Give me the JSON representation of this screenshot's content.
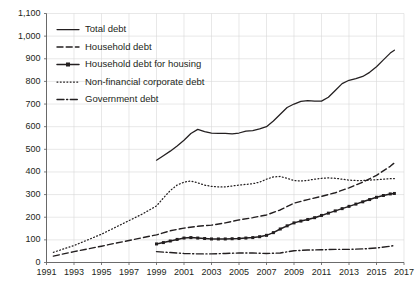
{
  "chart_data": {
    "type": "line",
    "title": "",
    "subtitle": "",
    "xlabel": "",
    "ylabel": "",
    "xlim": [
      1991,
      2017
    ],
    "ylim": [
      0,
      1100
    ],
    "ytick_step": 100,
    "xtick_step": 2,
    "grid": true,
    "legend_position": "top-left",
    "ytick_labels": [
      "0",
      "100",
      "200",
      "300",
      "400",
      "500",
      "600",
      "700",
      "800",
      "900",
      "1,000",
      "1,100"
    ],
    "ytick_values": [
      0,
      100,
      200,
      300,
      400,
      500,
      600,
      700,
      800,
      900,
      1000,
      1100
    ],
    "xtick_labels": [
      "1991",
      "1993",
      "1995",
      "1997",
      "1999",
      "2001",
      "2003",
      "2005",
      "2007",
      "2009",
      "2011",
      "2013",
      "2015",
      "2017"
    ],
    "xtick_values": [
      1991,
      1993,
      1995,
      1997,
      1999,
      2001,
      2003,
      2005,
      2007,
      2009,
      2011,
      2013,
      2015,
      2017
    ],
    "series": [
      {
        "name": "Total debt",
        "style": "solid",
        "color": "#231f20",
        "marker": "none",
        "x": [
          1999.0,
          1999.5,
          2000.0,
          2000.5,
          2001.0,
          2001.5,
          2002.0,
          2002.5,
          2003.0,
          2003.5,
          2004.0,
          2004.5,
          2005.0,
          2005.5,
          2006.0,
          2006.5,
          2007.0,
          2007.5,
          2008.0,
          2008.5,
          2009.0,
          2009.5,
          2010.0,
          2010.5,
          2011.0,
          2011.5,
          2012.0,
          2012.5,
          2013.0,
          2013.5,
          2014.0,
          2014.5,
          2015.0,
          2015.5,
          2016.0,
          2016.3
        ],
        "values": [
          452,
          472,
          492,
          515,
          540,
          570,
          588,
          578,
          572,
          570,
          570,
          568,
          572,
          580,
          583,
          590,
          600,
          625,
          655,
          685,
          700,
          712,
          715,
          713,
          713,
          730,
          760,
          790,
          805,
          812,
          822,
          840,
          865,
          895,
          925,
          938
        ]
      },
      {
        "name": "Household debt",
        "style": "dashed",
        "color": "#231f20",
        "marker": "none",
        "x": [
          1991.5,
          1992,
          1993,
          1994,
          1995,
          1996,
          1997,
          1998,
          1999,
          2000,
          2001,
          2002,
          2003,
          2004,
          2005,
          2006,
          2007,
          2008,
          2009,
          2010,
          2011,
          2012,
          2013,
          2014,
          2015,
          2016,
          2016.3
        ],
        "values": [
          28,
          35,
          48,
          60,
          72,
          85,
          97,
          110,
          122,
          140,
          152,
          160,
          165,
          175,
          188,
          198,
          210,
          232,
          262,
          278,
          292,
          308,
          330,
          355,
          385,
          425,
          440
        ]
      },
      {
        "name": "Household debt for housing",
        "style": "solid-marker",
        "color": "#231f20",
        "marker": "square",
        "x": [
          1999,
          1999.5,
          2000,
          2000.5,
          2001,
          2001.5,
          2002,
          2002.5,
          2003,
          2003.5,
          2004,
          2004.5,
          2005,
          2005.5,
          2006,
          2006.5,
          2007,
          2007.5,
          2008,
          2008.5,
          2009,
          2009.5,
          2010,
          2010.5,
          2011,
          2011.5,
          2012,
          2012.5,
          2013,
          2013.5,
          2014,
          2014.5,
          2015,
          2015.5,
          2016,
          2016.3
        ],
        "values": [
          82,
          88,
          95,
          102,
          108,
          110,
          108,
          106,
          104,
          104,
          104,
          105,
          106,
          108,
          110,
          114,
          120,
          132,
          148,
          162,
          175,
          183,
          190,
          198,
          208,
          218,
          228,
          238,
          248,
          258,
          268,
          278,
          288,
          296,
          303,
          305
        ]
      },
      {
        "name": "Non-financial corporate debt",
        "style": "dotted",
        "color": "#231f20",
        "marker": "none",
        "x": [
          1991.5,
          1992,
          1993,
          1994,
          1995,
          1996,
          1997,
          1998,
          1999,
          1999.5,
          2000,
          2000.5,
          2001,
          2001.5,
          2002,
          2002.5,
          2003,
          2003.5,
          2004,
          2004.5,
          2005,
          2005.5,
          2006,
          2006.5,
          2007,
          2007.5,
          2008,
          2008.5,
          2009,
          2009.5,
          2010,
          2010.5,
          2011,
          2011.5,
          2012,
          2012.5,
          2013,
          2013.5,
          2014,
          2014.5,
          2015,
          2015.5,
          2016,
          2016.3
        ],
        "values": [
          45,
          55,
          75,
          100,
          125,
          155,
          185,
          215,
          250,
          285,
          318,
          342,
          355,
          360,
          352,
          342,
          336,
          334,
          334,
          338,
          342,
          345,
          348,
          355,
          368,
          378,
          380,
          372,
          362,
          360,
          363,
          368,
          372,
          374,
          372,
          368,
          364,
          362,
          362,
          364,
          366,
          368,
          370,
          371
        ]
      },
      {
        "name": "Government debt",
        "style": "dash-dot",
        "color": "#231f20",
        "marker": "none",
        "x": [
          1999,
          2000,
          2001,
          2002,
          2003,
          2004,
          2005,
          2006,
          2007,
          2008,
          2009,
          2010,
          2011,
          2012,
          2013,
          2014,
          2015,
          2016,
          2016.3
        ],
        "values": [
          48,
          44,
          40,
          38,
          38,
          40,
          42,
          42,
          40,
          42,
          52,
          55,
          56,
          58,
          58,
          60,
          64,
          72,
          75
        ]
      }
    ]
  },
  "legend": {
    "items": [
      {
        "label": "Total debt",
        "style": "solid"
      },
      {
        "label": "Household debt",
        "style": "dashed"
      },
      {
        "label": "Household debt for housing",
        "style": "solid-marker"
      },
      {
        "label": "Non-financial corporate debt",
        "style": "dotted"
      },
      {
        "label": "Government debt",
        "style": "dash-dot"
      }
    ]
  }
}
